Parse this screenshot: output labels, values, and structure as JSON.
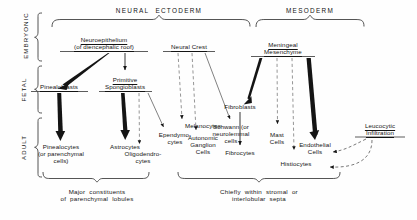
{
  "figure": {
    "germ_layers": [
      {
        "id": "neural-ectoderm",
        "label": "NEURAL  ECTODERM"
      },
      {
        "id": "mesoderm",
        "label": "MESODERM"
      }
    ],
    "stages": [
      {
        "id": "embryonic",
        "label": "EMBRYONIC"
      },
      {
        "id": "fetal",
        "label": "FETAL"
      },
      {
        "id": "adult",
        "label": "ADULT"
      }
    ],
    "nodes": [
      {
        "id": "neuroepithelium",
        "label": "Neuroepithelium\n(of diencephalic roof)",
        "stage": "embryonic",
        "underlined": true
      },
      {
        "id": "neural-crest",
        "label": "Neural Crest",
        "stage": "embryonic",
        "underlined": true
      },
      {
        "id": "meningeal-mesenchyme",
        "label": "Meningeal\nMesenchyme",
        "stage": "embryonic",
        "underlined": true
      },
      {
        "id": "pinealoblasts",
        "label": "Pinealoblasts",
        "stage": "fetal",
        "underlined": true
      },
      {
        "id": "primitive-spongioblasts",
        "label": "Primitive\nSpongioblasts",
        "stage": "fetal",
        "underlined": true
      },
      {
        "id": "fibroblasts",
        "label": "Fibroblasts",
        "stage": "fetal",
        "underlined": false
      },
      {
        "id": "melanocytes",
        "label": "Melanocytes",
        "stage": "fetal",
        "underlined": false
      },
      {
        "id": "schwann-cells",
        "label": "Schwann (or\nneurolemmal\ncells",
        "stage": "fetal",
        "underlined": false
      },
      {
        "id": "pinealocytes",
        "label": "Pinealocytes\n(or parenchymal\ncells)",
        "stage": "adult",
        "underlined": false
      },
      {
        "id": "astrocytes",
        "label": "Astrocytes",
        "stage": "adult",
        "underlined": false
      },
      {
        "id": "oligodendrocytes",
        "label": "Oligodendro-\ncytes",
        "stage": "adult",
        "underlined": false
      },
      {
        "id": "ependymocytes",
        "label": "Ependymo-\ncytes",
        "stage": "adult",
        "underlined": false
      },
      {
        "id": "autonomic-ganglion-cells",
        "label": "Autonomic\nGanglion\nCells",
        "stage": "adult",
        "underlined": false
      },
      {
        "id": "fibrocytes",
        "label": "Fibrocytes",
        "stage": "adult",
        "underlined": false
      },
      {
        "id": "mast-cells",
        "label": "Mast\nCells",
        "stage": "adult",
        "underlined": false
      },
      {
        "id": "endothelial-cells",
        "label": "Endothelial\nCells",
        "stage": "adult",
        "underlined": false
      },
      {
        "id": "histiocytes",
        "label": "Histiocytes",
        "stage": "adult",
        "underlined": false
      },
      {
        "id": "leucocytic-infiltration",
        "label": "Leucocytic\nInfiltration",
        "stage": "adult",
        "underlined": true
      }
    ],
    "captions": [
      {
        "id": "parenchymal-caption",
        "label": "Major  constituents\nof  parenchymal  lobules"
      },
      {
        "id": "stromal-caption",
        "label": "Chiefly  within  stromal  or\ninterlobular  septa"
      }
    ],
    "edges": [
      {
        "from": "neuroepithelium",
        "to": "pinealoblasts",
        "style": "thick"
      },
      {
        "from": "neuroepithelium",
        "to": "primitive-spongioblasts",
        "style": "thin"
      },
      {
        "from": "pinealoblasts",
        "to": "pinealocytes",
        "style": "thick"
      },
      {
        "from": "primitive-spongioblasts",
        "to": "astrocytes",
        "style": "thick"
      },
      {
        "from": "primitive-spongioblasts",
        "to": "oligodendrocytes",
        "style": "dashed"
      },
      {
        "from": "primitive-spongioblasts",
        "to": "ependymocytes",
        "style": "thin"
      },
      {
        "from": "neural-crest",
        "to": "melanocytes",
        "style": "dashed"
      },
      {
        "from": "neural-crest",
        "to": "autonomic-ganglion-cells",
        "style": "dashed"
      },
      {
        "from": "neural-crest",
        "to": "schwann-cells",
        "style": "thin"
      },
      {
        "from": "meningeal-mesenchyme",
        "to": "fibroblasts",
        "style": "thick"
      },
      {
        "from": "meningeal-mesenchyme",
        "to": "mast-cells",
        "style": "dashed"
      },
      {
        "from": "meningeal-mesenchyme",
        "to": "histiocytes",
        "style": "dashed"
      },
      {
        "from": "meningeal-mesenchyme",
        "to": "endothelial-cells",
        "style": "thick"
      },
      {
        "from": "fibroblasts",
        "to": "fibrocytes",
        "style": "thin"
      },
      {
        "from": "leucocytic-infiltration",
        "to": "endothelial-cells",
        "style": "dashed-curve"
      },
      {
        "from": "leucocytic-infiltration",
        "to": "histiocytes",
        "style": "dashed-curve"
      }
    ],
    "colors": {
      "ink": "#141414",
      "background": "#ffffff"
    }
  }
}
